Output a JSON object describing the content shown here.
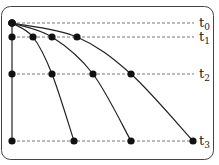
{
  "diagram": {
    "type": "time-evolution-curves",
    "levels": [
      {
        "id": "t0",
        "label": "t",
        "subscript": "0",
        "y": 23
      },
      {
        "id": "t1",
        "label": "t",
        "subscript": "1",
        "y": 37
      },
      {
        "id": "t2",
        "label": "t",
        "subscript": "2",
        "y": 74
      },
      {
        "id": "t3",
        "label": "t",
        "subscript": "3",
        "y": 141
      }
    ],
    "origin": {
      "x": 12,
      "y": 23
    },
    "curves": [
      {
        "name": "curve-vertical",
        "points": [
          [
            12,
            23
          ],
          [
            12,
            37
          ],
          [
            12,
            74
          ],
          [
            12,
            141
          ]
        ]
      },
      {
        "name": "curve-1",
        "points": [
          [
            12,
            23
          ],
          [
            33,
            37
          ],
          [
            52,
            74
          ],
          [
            74,
            141
          ]
        ]
      },
      {
        "name": "curve-2",
        "points": [
          [
            12,
            23
          ],
          [
            52,
            37
          ],
          [
            93,
            74
          ],
          [
            131,
            141
          ]
        ]
      },
      {
        "name": "curve-3",
        "points": [
          [
            12,
            23
          ],
          [
            77,
            37
          ],
          [
            131,
            74
          ],
          [
            193,
            141
          ]
        ]
      }
    ],
    "colors": {
      "line": "#222222",
      "dash": "#555555",
      "frame": "#444444"
    }
  }
}
